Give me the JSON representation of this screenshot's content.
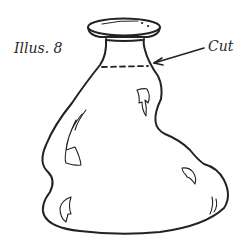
{
  "figure": {
    "title": "Illus. 8",
    "callout_label": "Cut",
    "colors": {
      "line": "#222222",
      "background": "#ffffff"
    }
  }
}
